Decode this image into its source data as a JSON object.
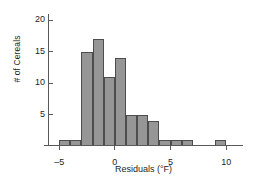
{
  "chart_data": {
    "type": "bar",
    "title": "",
    "subtitle": "",
    "xlabel": "Residuals (°F)",
    "ylabel": "# of Cereals",
    "xlim": [
      -6,
      11.5
    ],
    "ylim": [
      0,
      21
    ],
    "grid": false,
    "legend": null,
    "bin_width": 1,
    "x_ticks": [
      -5,
      0,
      5,
      10
    ],
    "x_tick_labels": [
      "–5",
      "0",
      "5",
      "10"
    ],
    "y_ticks": [
      5,
      10,
      15,
      20
    ],
    "y_tick_labels": [
      "5",
      "10",
      "15",
      "20"
    ],
    "bin_starts": [
      -5,
      -4,
      -3,
      -2,
      -1,
      0,
      1,
      2,
      3,
      4,
      5,
      6,
      9
    ],
    "categories": [
      "-5",
      "-4",
      "-3",
      "-2",
      "-1",
      "0",
      "1",
      "2",
      "3",
      "4",
      "5",
      "6",
      "9"
    ],
    "values": [
      1,
      1,
      15,
      17,
      11,
      14,
      5,
      5,
      4,
      1,
      1,
      1,
      1
    ],
    "bar_fill_color": "#969696",
    "bar_edge_color": "#4d4d4d",
    "axis_color": "#58595b",
    "text_color": "#231f20",
    "background_color": "#ffffff"
  }
}
